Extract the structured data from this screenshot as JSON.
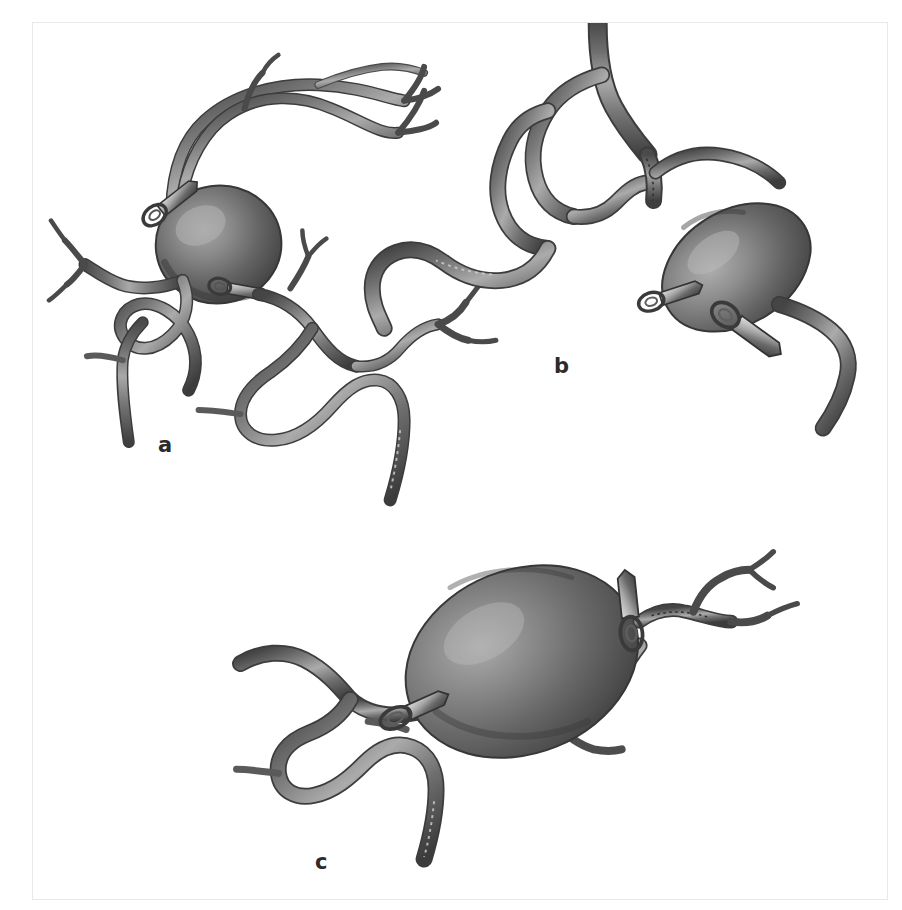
{
  "figure": {
    "kind": "medical-illustration",
    "modality": "grayscale airbrush rendering",
    "frame": {
      "border_color": "#e9e9e9",
      "background_color": "#ffffff"
    }
  },
  "palette": {
    "background": "#ffffff",
    "vessel_mid": "#7b7b7b",
    "vessel_dark": "#4a4a4a",
    "vessel_outline": "#3b3b3b",
    "vessel_highlight": "#b9b9b9",
    "aneurysm_dark": "#4c4c4c",
    "aneurysm_mid": "#6e6e6e",
    "aneurysm_highlight": "#9e9e9e",
    "clip_metal_light": "#d0d0d0",
    "clip_metal_mid": "#8a8a8a",
    "clip_metal_dark": "#3a3a3a",
    "label_color": "#2b2b2b",
    "frame_border": "#e9e9e9"
  },
  "panels": [
    {
      "id": "a",
      "label": "a",
      "label_position": {
        "x": 125,
        "y": 412
      },
      "description": "Saccular aneurysm at a vessel bifurcation with two clips across the neck; long branching arteries sweep up and to the right, a tangled arterial tree below.",
      "aneurysm": {
        "shape": "sphere",
        "cx": 186,
        "cy": 222,
        "rx": 62,
        "ry": 58,
        "rotation": -8
      },
      "clips": [
        {
          "id": "a-clip-1",
          "x": 133,
          "y": 184,
          "angle": -38,
          "length": 44
        },
        {
          "id": "a-clip-2",
          "x": 199,
          "y": 266,
          "angle": 12,
          "length": 40
        }
      ]
    },
    {
      "id": "b",
      "label": "b",
      "label_position": {
        "x": 521,
        "y": 333
      },
      "description": "Oblique ellipsoidal aneurysm projecting from a bifurcation, occluded by two clips; a sutured/serrated vessel segment runs into the neck.",
      "aneurysm": {
        "shape": "ellipsoid",
        "cx": 705,
        "cy": 245,
        "rx": 78,
        "ry": 56,
        "rotation": -32
      },
      "clips": [
        {
          "id": "b-clip-1",
          "x": 633,
          "y": 275,
          "angle": -18,
          "length": 42
        },
        {
          "id": "b-clip-2",
          "x": 690,
          "y": 318,
          "angle": 28,
          "length": 56
        }
      ]
    },
    {
      "id": "c",
      "label": "c",
      "label_position": {
        "x": 282,
        "y": 829
      },
      "description": "Giant aneurysm occupying the centre of the field with clips at both ends of its neck; serpentine parent arteries run from lower-left to upper-right.",
      "aneurysm": {
        "shape": "ellipsoid",
        "cx": 490,
        "cy": 640,
        "rx": 118,
        "ry": 90,
        "rotation": -22
      },
      "clips": [
        {
          "id": "c-clip-1",
          "x": 372,
          "y": 686,
          "angle": -28,
          "length": 46
        },
        {
          "id": "c-clip-2",
          "x": 600,
          "y": 570,
          "angle": -8,
          "length": 56
        }
      ]
    }
  ],
  "labels": {
    "a": "a",
    "b": "b",
    "c": "c"
  }
}
